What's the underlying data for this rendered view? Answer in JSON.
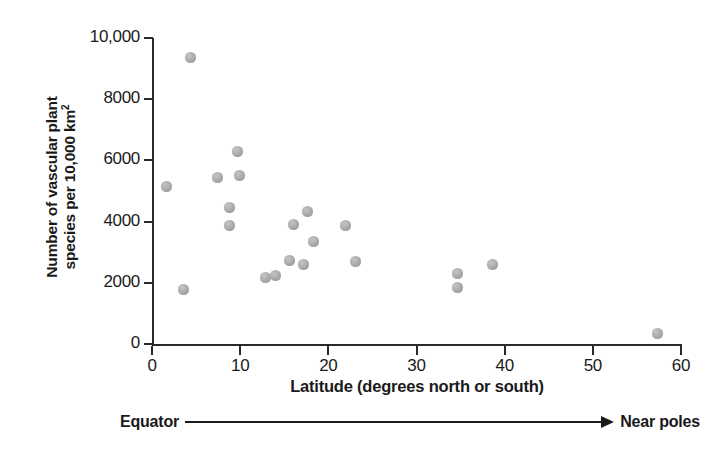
{
  "chart_data": {
    "type": "scatter",
    "title": "",
    "xlabel": "Latitude (degrees north or south)",
    "ylabel_line1": "Number of vascular plant",
    "ylabel_line2_pre": "species per 10,000 km",
    "ylabel_line2_sup": "2",
    "xlim": [
      0,
      60
    ],
    "ylim": [
      0,
      10000
    ],
    "grid": false,
    "legend": null,
    "xticks": [
      0,
      10,
      20,
      30,
      40,
      50,
      60
    ],
    "xtick_labels": [
      "0",
      "10",
      "20",
      "30",
      "40",
      "50",
      "60"
    ],
    "yticks": [
      0,
      2000,
      4000,
      6000,
      8000,
      10000
    ],
    "ytick_labels": [
      "0",
      "2000",
      "4000",
      "6000",
      "8000",
      "10,000"
    ],
    "marker_color": "#a8a8a8",
    "axis_color": "#2a2a2a",
    "points": [
      {
        "x": 1.6,
        "y": 5150
      },
      {
        "x": 3.6,
        "y": 1780
      },
      {
        "x": 4.4,
        "y": 9350
      },
      {
        "x": 7.4,
        "y": 5450
      },
      {
        "x": 8.8,
        "y": 4450
      },
      {
        "x": 8.8,
        "y": 3880
      },
      {
        "x": 9.7,
        "y": 6300
      },
      {
        "x": 9.9,
        "y": 5500
      },
      {
        "x": 12.9,
        "y": 2170
      },
      {
        "x": 14.0,
        "y": 2250
      },
      {
        "x": 15.6,
        "y": 2720
      },
      {
        "x": 16.0,
        "y": 3890
      },
      {
        "x": 17.2,
        "y": 2600
      },
      {
        "x": 17.6,
        "y": 4320
      },
      {
        "x": 18.3,
        "y": 3350
      },
      {
        "x": 22.0,
        "y": 3880
      },
      {
        "x": 23.1,
        "y": 2710
      },
      {
        "x": 34.6,
        "y": 2320
      },
      {
        "x": 34.6,
        "y": 1860
      },
      {
        "x": 38.6,
        "y": 2600
      },
      {
        "x": 57.3,
        "y": 330
      }
    ]
  },
  "annotation": {
    "left_label": "Equator",
    "right_label": "Near poles",
    "arrow": "right-arrow"
  }
}
